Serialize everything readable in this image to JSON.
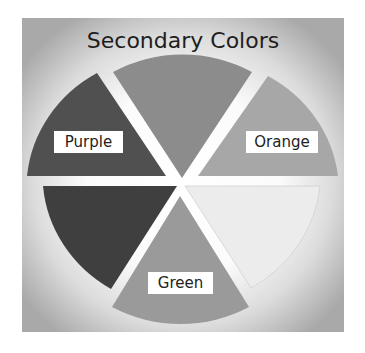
{
  "title": "Secondary Colors",
  "wheel": {
    "center": [
      182,
      184
    ],
    "wedges": [
      {
        "name": "top",
        "label": "",
        "start": 240,
        "end": 300,
        "fill": "#8c8c8c"
      },
      {
        "name": "orange",
        "label": "Orange",
        "start": 300,
        "end": 360,
        "fill": "#a7a7a7"
      },
      {
        "name": "light",
        "label": "",
        "start": 0,
        "end": 60,
        "fill": "#ececec"
      },
      {
        "name": "green",
        "label": "Green",
        "start": 60,
        "end": 120,
        "fill": "#9a9a9a"
      },
      {
        "name": "dark",
        "label": "",
        "start": 120,
        "end": 180,
        "fill": "#3f3f3f"
      },
      {
        "name": "purple",
        "label": "Purple",
        "start": 180,
        "end": 240,
        "fill": "#505050"
      }
    ]
  },
  "labels": {
    "purple": "Purple",
    "orange": "Orange",
    "green": "Green"
  },
  "colors": {
    "panel_edge": "#a9a9a9",
    "panel_center": "#ffffff",
    "gap": "#ffffff"
  }
}
